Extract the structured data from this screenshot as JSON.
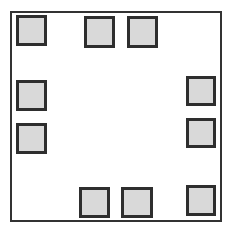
{
  "diagram": {
    "type": "package-pad-layout",
    "frame": {
      "x": 10,
      "y": 11,
      "w": 212,
      "h": 211,
      "border_color": "#333333",
      "fill": "#ffffff"
    },
    "pad_style": {
      "border_color": "#2e2e2e",
      "fill": "#d9d9d9"
    },
    "pads": [
      {
        "id": "top-left",
        "x": 16,
        "y": 15,
        "w": 31,
        "h": 31
      },
      {
        "id": "top-1",
        "x": 84,
        "y": 16,
        "w": 31,
        "h": 32
      },
      {
        "id": "top-2",
        "x": 127,
        "y": 16,
        "w": 31,
        "h": 32
      },
      {
        "id": "right-1",
        "x": 186,
        "y": 76,
        "w": 30,
        "h": 30
      },
      {
        "id": "right-2",
        "x": 186,
        "y": 118,
        "w": 30,
        "h": 30
      },
      {
        "id": "left-1",
        "x": 16,
        "y": 80,
        "w": 31,
        "h": 31
      },
      {
        "id": "left-2",
        "x": 16,
        "y": 123,
        "w": 31,
        "h": 31
      },
      {
        "id": "bottom-1",
        "x": 79,
        "y": 187,
        "w": 31,
        "h": 31
      },
      {
        "id": "bottom-2",
        "x": 121,
        "y": 187,
        "w": 32,
        "h": 31
      },
      {
        "id": "bottom-right",
        "x": 186,
        "y": 185,
        "w": 30,
        "h": 31
      }
    ]
  }
}
